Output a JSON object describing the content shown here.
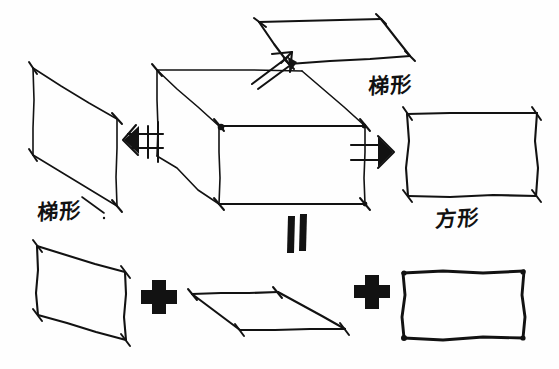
{
  "canvas": {
    "width": 559,
    "height": 369,
    "background_color": "#ffffff",
    "ink_color": "#121212",
    "medium": "hand-drawn pen sketch"
  },
  "labels": {
    "top_right_trapezoid": "梯形",
    "left_trapezoid": "梯形",
    "right_square": "方形"
  },
  "operators": {
    "plus_left": "+",
    "plus_right": "+",
    "equals_vertical": "=",
    "arrow_left": "left-double-arrow",
    "arrow_right": "right-double-arrow",
    "arrow_up": "up-right-arrow"
  },
  "shapes": {
    "top_parallelogram": {
      "name": "top-face-parallelogram",
      "label": "梯形",
      "points": "260,22 380,18 410,57 288,64"
    },
    "left_trapezoid_exploded": {
      "name": "left-face-trapezoid",
      "label": "梯形",
      "points": "32,68 116,118 116,205 32,155"
    },
    "right_rectangle_exploded": {
      "name": "right-face-square",
      "label": "方形",
      "points": "407,113 537,113 537,196 407,196"
    },
    "cube": {
      "name": "central-3d-box",
      "front_face": "218,125 364,125 364,203 218,203",
      "top_back_edge": "157,70 302,70",
      "left_back_edge": "157,70 157,155",
      "top_face": "157,70 302,70 364,125 218,125",
      "left_face": "157,70 218,125 218,203 157,155"
    },
    "bottom_trapezoid": {
      "name": "result-trapezoid",
      "points": "37,246 125,272 125,340 37,315"
    },
    "bottom_parallelogram": {
      "name": "result-parallelogram",
      "points": "192,294 277,293 345,328 240,330"
    },
    "bottom_rectangle": {
      "name": "result-square",
      "points": "403,272 524,272 524,338 403,338"
    }
  },
  "equation": {
    "description": "3D box decomposes into trapezoid + parallelogram + square",
    "terms": [
      "梯形",
      "梯形",
      "方形"
    ],
    "operator_sequence": [
      "=",
      "+",
      "+"
    ]
  }
}
